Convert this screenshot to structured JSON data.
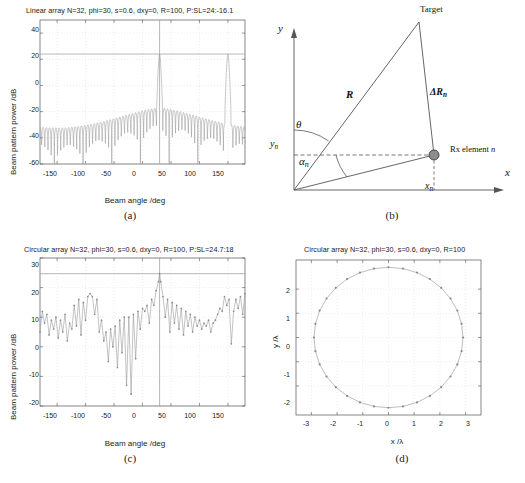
{
  "figure": {
    "captions": {
      "a": "(a)",
      "b": "(b)",
      "c": "(c)",
      "d": "(d)"
    }
  },
  "panel_a": {
    "title": "Linear array N=32, phi=30, s=0.6, dxy=0, R=100, P:SL=24:-16.1",
    "xlabel": "Beam angle /deg",
    "ylabel": "Beam pattern power /dB",
    "xticks": [
      "-150",
      "-100",
      "-50",
      "0",
      "50",
      "100",
      "150"
    ],
    "yticks": [
      "40",
      "20",
      "0",
      "-20",
      "-40",
      "-60"
    ]
  },
  "panel_b": {
    "target_label": "Target",
    "range_label": "R",
    "delta_range_label": "ΔR",
    "delta_range_sub": "n",
    "theta_label": "θ",
    "alpha_label": "α",
    "alpha_sub": "n",
    "yn_label": "y",
    "yn_sub": "n",
    "xn_label": "x",
    "xn_sub": "n",
    "x_axis_label": "x",
    "y_axis_label": "y",
    "element_label": "Rx element ",
    "element_label_italic": "n"
  },
  "panel_c": {
    "title": "Circular array N=32, phi=30, s=0.6, dxy=0, R=100, P:SL=24.7:18",
    "xlabel": "Beam angle /deg",
    "ylabel": "Beam pattern power /dB",
    "xticks": [
      "-150",
      "-100",
      "-50",
      "0",
      "50",
      "100",
      "150"
    ],
    "yticks": [
      "30",
      "20",
      "10",
      "0",
      "-10",
      "-20"
    ]
  },
  "panel_d": {
    "title": "Circular array N=32, phi=30, s=0.6, dxy=0, R=100",
    "xlabel": "x /λ",
    "ylabel": "y /λ",
    "xticks": [
      "-3",
      "-2",
      "-1",
      "0",
      "1",
      "2",
      "3"
    ],
    "yticks": [
      "2",
      "1",
      "0",
      "-1",
      "-2"
    ]
  },
  "colors": {
    "curve": "#9a9a9a",
    "axis": "#555555",
    "grid": "#d8d8d8",
    "marker": "#8a8a8a",
    "element_fill": "#8d8d8d",
    "text": "#1a1a1a"
  },
  "chart_data": [
    {
      "type": "line",
      "id": "panel_a",
      "title": "Linear array N=32, phi=30, s=0.6, dxy=0, R=100, P:SL=24:-16.1",
      "xlabel": "Beam angle /deg",
      "ylabel": "Beam pattern power /dB",
      "xlim": [
        -180,
        180
      ],
      "ylim": [
        -60,
        50
      ],
      "xtick_values": [
        -150,
        -100,
        -50,
        0,
        50,
        100,
        150
      ],
      "ytick_values": [
        40,
        20,
        0,
        -20,
        -40,
        -60
      ],
      "grid": true,
      "legend": "none",
      "annotations": [
        {
          "kind": "horizontal-line",
          "y": 24,
          "note": "peak power level P=24 dB"
        },
        {
          "kind": "vertical-line",
          "x": 30,
          "note": "steer angle phi=30 deg"
        }
      ],
      "notes": "Two grating-lobe main peaks at +30 deg and +150 deg reaching 24 dB; sidelobe envelope near -16.1 dB falling to -60 dB nulls.",
      "main_lobes": [
        {
          "angle": 30,
          "peak_db": 24
        },
        {
          "angle": 150,
          "peak_db": 24
        }
      ],
      "sidelobe_level_db": -16.1,
      "series": [
        {
          "name": "beam pattern",
          "x": [
            -180,
            -177,
            -174,
            -171,
            -168,
            -165,
            -162,
            -159,
            -156,
            -153,
            -150,
            -147,
            -144,
            -141,
            -138,
            -135,
            -132,
            -129,
            -126,
            -123,
            -120,
            -117,
            -114,
            -111,
            -108,
            -105,
            -102,
            -99,
            -96,
            -93,
            -90,
            -87,
            -84,
            -81,
            -78,
            -75,
            -72,
            -69,
            -66,
            -63,
            -60,
            -57,
            -54,
            -51,
            -48,
            -45,
            -42,
            -39,
            -36,
            -33,
            -30,
            -27,
            -24,
            -21,
            -18,
            -15,
            -12,
            -9,
            -6,
            -3,
            0,
            3,
            6,
            9,
            12,
            15,
            18,
            21,
            24,
            27,
            30,
            33,
            36,
            39,
            42,
            45,
            48,
            51,
            54,
            57,
            60,
            63,
            66,
            69,
            72,
            75,
            78,
            81,
            84,
            87,
            90,
            93,
            96,
            99,
            102,
            105,
            108,
            111,
            114,
            117,
            120,
            123,
            126,
            129,
            132,
            135,
            138,
            141,
            144,
            147,
            150,
            153,
            156,
            159,
            162,
            165,
            168,
            171,
            174,
            177,
            180
          ],
          "y": [
            -17,
            -30,
            -19,
            -48,
            -20,
            -33,
            -18,
            -44,
            -19,
            -30,
            -18,
            -40,
            -19,
            -32,
            -19,
            -45,
            -20,
            -31,
            -20,
            -38,
            -21,
            -33,
            -21,
            -47,
            -22,
            -32,
            -21,
            -36,
            -22,
            -34,
            -22,
            -50,
            -23,
            -33,
            -22,
            -37,
            -23,
            -34,
            -23,
            -44,
            -23,
            -34,
            -23,
            -38,
            -24,
            -35,
            -23,
            -46,
            -24,
            -35,
            -23,
            -39,
            -24,
            -35,
            -24,
            -48,
            -24,
            -35,
            -24,
            -39,
            -24,
            -35,
            -24,
            -47,
            -23,
            -34,
            -23,
            -38,
            -22,
            -30,
            24,
            -30,
            -22,
            -37,
            -21,
            -32,
            -20,
            -43,
            -20,
            -31,
            -19,
            -35,
            -19,
            -30,
            -18,
            -41,
            -18,
            -29,
            -17,
            -33,
            -17,
            -28,
            -16,
            -39,
            -17,
            -28,
            -17,
            -32,
            -17,
            -28,
            -17,
            -38,
            -18,
            -29,
            -18,
            -33,
            -18,
            -29,
            -17,
            -33,
            -16,
            24,
            -16,
            -29,
            -17,
            -32,
            -17,
            -29,
            -17,
            -35,
            -17,
            -28,
            -17
          ]
        }
      ]
    },
    {
      "type": "line",
      "id": "panel_c",
      "title": "Circular array N=32, phi=30, s=0.6, dxy=0, R=100, P:SL=24.7:18",
      "xlabel": "Beam angle /deg",
      "ylabel": "Beam pattern power /dB",
      "xlim": [
        -180,
        180
      ],
      "ylim": [
        -20,
        30
      ],
      "xtick_values": [
        -150,
        -100,
        -50,
        0,
        50,
        100,
        150
      ],
      "ytick_values": [
        30,
        20,
        10,
        0,
        -10,
        -20
      ],
      "grid": true,
      "legend": "none",
      "markers": true,
      "annotations": [
        {
          "kind": "horizontal-line",
          "y": 24.7,
          "note": "peak power level P=24.7 dB"
        },
        {
          "kind": "vertical-line",
          "x": 30,
          "note": "steer angle phi=30 deg"
        }
      ],
      "notes": "Single main lobe at +30 deg reaching 24.7 dB; irregular sidelobe structure with peak sidelobe near 18 dB around -90 deg.",
      "main_lobes": [
        {
          "angle": 30,
          "peak_db": 24.7
        }
      ],
      "sidelobe_level_db": 18,
      "series": [
        {
          "name": "beam pattern",
          "x": [
            -180,
            -176,
            -172,
            -168,
            -164,
            -160,
            -156,
            -152,
            -148,
            -144,
            -140,
            -136,
            -132,
            -128,
            -124,
            -120,
            -116,
            -112,
            -108,
            -104,
            -100,
            -96,
            -92,
            -88,
            -84,
            -80,
            -76,
            -72,
            -68,
            -64,
            -60,
            -56,
            -52,
            -48,
            -44,
            -40,
            -36,
            -32,
            -28,
            -24,
            -20,
            -16,
            -12,
            -8,
            -4,
            0,
            4,
            8,
            12,
            16,
            20,
            24,
            28,
            30,
            32,
            36,
            40,
            44,
            48,
            52,
            56,
            60,
            64,
            68,
            72,
            76,
            80,
            84,
            88,
            92,
            96,
            100,
            104,
            108,
            112,
            116,
            120,
            124,
            128,
            132,
            136,
            140,
            144,
            148,
            152,
            156,
            160,
            164,
            168,
            172,
            176,
            180
          ],
          "y": [
            5,
            12,
            8,
            11,
            4,
            9,
            6,
            10,
            3,
            9,
            5,
            11,
            2,
            8,
            6,
            14,
            7,
            16,
            4,
            15,
            9,
            17,
            18,
            17,
            11,
            16,
            5,
            9,
            2,
            5,
            -5,
            6,
            0,
            7,
            -7,
            9,
            -2,
            10,
            -13,
            10,
            -16,
            11,
            -4,
            12,
            6,
            13,
            12,
            14,
            8,
            16,
            14,
            19,
            22,
            24.7,
            22,
            17,
            10,
            16,
            5,
            15,
            8,
            14,
            6,
            13,
            4,
            12,
            7,
            11,
            5,
            10,
            7,
            9,
            6,
            8,
            7,
            9,
            5,
            8,
            9,
            11,
            13,
            12,
            17,
            14,
            16,
            1,
            12,
            16,
            13,
            17,
            11,
            18,
            4
          ]
        }
      ]
    },
    {
      "type": "scatter",
      "id": "panel_d",
      "title": "Circular array N=32, phi=30, s=0.6, dxy=0, R=100",
      "xlabel": "x /λ",
      "ylabel": "y /λ",
      "xlim": [
        -3.6,
        3.6
      ],
      "ylim": [
        -3.2,
        3.2
      ],
      "xtick_values": [
        -3,
        -2,
        -1,
        0,
        1,
        2,
        3
      ],
      "ytick_values": [
        2,
        1,
        0,
        -1,
        -2
      ],
      "grid": true,
      "legend": "none",
      "notes": "32 receive elements uniformly spaced on a circle of radius 2.9 wavelengths, connected by a line.",
      "element_count": 32,
      "radius_lambda": 2.9
    }
  ]
}
